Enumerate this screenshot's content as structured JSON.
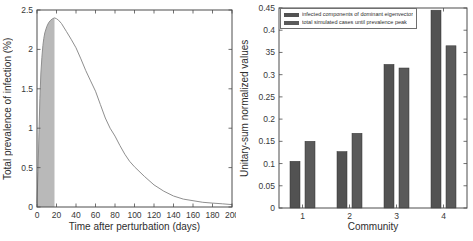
{
  "figure": {
    "background": "#ffffff"
  },
  "colors": {
    "axis": "#4d4d4d",
    "tick_text": "#383838"
  },
  "chart_data": [
    {
      "type": "area",
      "title": "",
      "xlabel": "Time after perturbation (days)",
      "ylabel": "Total prevalence of infection (%)",
      "xlim": [
        0,
        200
      ],
      "ylim": [
        0,
        2.5
      ],
      "xticks": [
        0,
        20,
        40,
        60,
        80,
        100,
        120,
        140,
        160,
        180,
        200
      ],
      "xtick_labels": [
        "0",
        "20",
        "40",
        "60",
        "80",
        "100",
        "120",
        "140",
        "160",
        "180",
        "200"
      ],
      "yticks": [
        0,
        0.5,
        1,
        1.5,
        2,
        2.5
      ],
      "ytick_labels": [
        "0",
        "0.5",
        "1",
        "1.5",
        "2",
        "2.5"
      ],
      "grid": false,
      "line_color": "#8f8f8f",
      "curve": {
        "x": [
          0,
          1,
          2,
          3,
          4,
          5,
          6,
          7,
          8,
          10,
          12,
          14,
          16,
          18,
          20,
          22,
          25,
          30,
          35,
          40,
          45,
          50,
          55,
          60,
          65,
          70,
          75,
          80,
          85,
          90,
          95,
          100,
          110,
          120,
          130,
          140,
          150,
          160,
          170,
          180,
          190,
          200
        ],
        "y": [
          0.05,
          0.45,
          0.95,
          1.38,
          1.7,
          1.9,
          2.05,
          2.14,
          2.21,
          2.29,
          2.34,
          2.37,
          2.39,
          2.4,
          2.39,
          2.37,
          2.33,
          2.23,
          2.13,
          2.02,
          1.88,
          1.73,
          1.6,
          1.47,
          1.3,
          1.13,
          1.0,
          0.9,
          0.78,
          0.67,
          0.58,
          0.51,
          0.39,
          0.28,
          0.2,
          0.14,
          0.1,
          0.08,
          0.06,
          0.05,
          0.04,
          0.03
        ]
      },
      "peak": {
        "x": 18,
        "y": 2.4
      },
      "shaded_region": {
        "x_from": 0,
        "x_to": 18,
        "fill_color": "#b9b9b9"
      }
    },
    {
      "type": "bar",
      "title": "",
      "xlabel": "Community",
      "ylabel": "Unitary-sum normalized values",
      "categories": [
        "1",
        "2",
        "3",
        "4"
      ],
      "series": [
        {
          "name": "infected components of dominant eigenvector",
          "values": [
            0.105,
            0.127,
            0.323,
            0.445
          ],
          "color": "#525252"
        },
        {
          "name": "total simulated cases until prevalence peak",
          "values": [
            0.15,
            0.168,
            0.315,
            0.365
          ],
          "color": "#5a5a5a"
        }
      ],
      "ylim": [
        0,
        0.45
      ],
      "yticks": [
        0,
        0.05,
        0.1,
        0.15,
        0.2,
        0.25,
        0.3,
        0.35,
        0.4,
        0.45
      ],
      "ytick_labels": [
        "0",
        "0.05",
        "0.1",
        "0.15",
        "0.2",
        "0.25",
        "0.3",
        "35",
        "0.4",
        "0.45"
      ],
      "grid": false,
      "legend_position": "top-left"
    }
  ]
}
